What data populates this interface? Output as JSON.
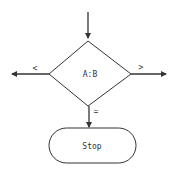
{
  "diagram": {
    "type": "flowchart",
    "decision": {
      "label": "A:B"
    },
    "branches": {
      "left": {
        "label": "<"
      },
      "right": {
        "label": ">"
      },
      "down": {
        "label": "="
      }
    },
    "terminal": {
      "label": "Stop"
    },
    "colors": {
      "stroke": "#333333",
      "background": "#ffffff"
    }
  }
}
